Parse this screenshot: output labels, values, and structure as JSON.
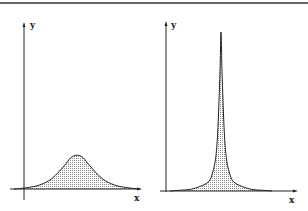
{
  "chart_data": [
    {
      "type": "area",
      "title": "",
      "xlabel": "x",
      "ylabel": "y",
      "description": "Broad bell-shaped peak with shaded (stippled) area under curve",
      "x": [
        0,
        10,
        20,
        30,
        40,
        45,
        50,
        55,
        60,
        70,
        80,
        90,
        100
      ],
      "values": [
        0,
        1,
        3,
        8,
        18,
        24,
        26,
        24,
        18,
        8,
        3,
        1,
        0
      ],
      "ylim": [
        0,
        100
      ],
      "grid": false,
      "legend": null
    },
    {
      "type": "area",
      "title": "",
      "xlabel": "x",
      "ylabel": "y",
      "description": "Narrow sharp (Lorentzian-like) peak with shaded (stippled) area under curve",
      "x": [
        0,
        10,
        20,
        30,
        38,
        42,
        45,
        47,
        49,
        50,
        51,
        53,
        55,
        58,
        62,
        70,
        80,
        90,
        100
      ],
      "values": [
        0,
        0.5,
        1,
        3,
        6,
        12,
        22,
        40,
        75,
        100,
        75,
        40,
        22,
        12,
        6,
        3,
        1,
        0.5,
        0
      ],
      "ylim": [
        0,
        100
      ],
      "grid": false,
      "legend": null
    }
  ],
  "labels": {
    "left": {
      "x_axis": "x",
      "y_axis": "y"
    },
    "right": {
      "x_axis": "x",
      "y_axis": "y"
    }
  },
  "colors": {
    "ink": "#222222",
    "fill": "#d9d9d9"
  }
}
